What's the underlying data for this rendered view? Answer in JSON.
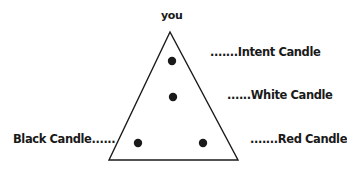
{
  "diagram": {
    "type": "candle-triangle-layout",
    "apex_label": "you",
    "shape": "triangle",
    "colors": {
      "line": "#1a1a1a",
      "dot": "#1a1a1a",
      "background": "#ffffff"
    },
    "triangle": {
      "apex": [
        170,
        32
      ],
      "base_left": [
        109,
        160
      ],
      "base_right": [
        238,
        160
      ]
    },
    "candles": [
      {
        "name": "Intent Candle",
        "label": ".......Intent Candle",
        "position": [
          172,
          61
        ]
      },
      {
        "name": "White Candle",
        "label": "......White Candle",
        "position": [
          173,
          97
        ]
      },
      {
        "name": "Black Candle",
        "label": "Black Candle......",
        "position": [
          138,
          143
        ]
      },
      {
        "name": "Red Candle",
        "label": ".......Red Candle",
        "position": [
          203,
          143
        ]
      }
    ]
  }
}
